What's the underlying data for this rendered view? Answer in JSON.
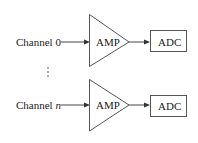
{
  "diagram": {
    "type": "block-diagram",
    "channels": [
      {
        "label_prefix": "Channel",
        "label_index": "0",
        "index_italic": false,
        "amplifier_label": "AMP",
        "converter_label": "ADC"
      },
      {
        "label_prefix": "Channel",
        "label_index": "n",
        "index_italic": true,
        "amplifier_label": "AMP",
        "converter_label": "ADC"
      }
    ],
    "ellipsis": "⋮",
    "colors": {
      "stroke": "#444444",
      "text": "#222222",
      "background": "#ffffff"
    }
  }
}
